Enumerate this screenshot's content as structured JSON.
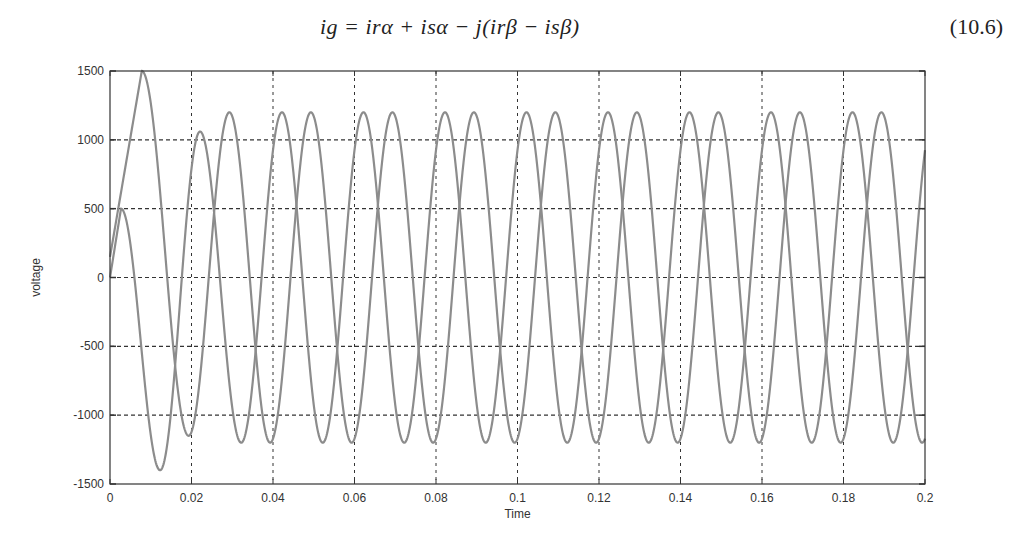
{
  "equation": {
    "text": "ig = irα + isα − j(irβ − isβ)",
    "number": "(10.6)"
  },
  "colors": {
    "curve": "#8c8c8c",
    "grid": "#333333",
    "axis": "#333333",
    "text": "#333333"
  },
  "chart_data": {
    "type": "line",
    "title": "",
    "xlabel": "Time",
    "ylabel": "voltage",
    "xlim": [
      0,
      0.2
    ],
    "ylim": [
      -1500,
      1500
    ],
    "xticks": [
      "0",
      "0.02",
      "0.04",
      "0.06",
      "0.08",
      "0.1",
      "0.12",
      "0.14",
      "0.16",
      "0.18",
      "0.2"
    ],
    "yticks": [
      "1500",
      "1000",
      "500",
      "0",
      "-500",
      "-1000",
      "-1500"
    ],
    "grid": true,
    "legend": null,
    "series": [
      {
        "name": "curve-a",
        "frequency_hz": 50,
        "steady_amplitude": 1200,
        "steady_peak_time": 0.0222,
        "transient_points": [
          [
            0,
            0
          ],
          [
            0.0027,
            500
          ],
          [
            0.0123,
            -1400
          ],
          [
            0.0221,
            1060
          ],
          [
            0.0322,
            -1200
          ]
        ]
      },
      {
        "name": "curve-b",
        "frequency_hz": 50,
        "steady_amplitude": 1200,
        "steady_peak_time": 0.0293,
        "transient_points": [
          [
            0,
            150
          ],
          [
            0.0078,
            1500
          ],
          [
            0.0193,
            -1150
          ],
          [
            0.0293,
            1200
          ]
        ]
      }
    ]
  }
}
